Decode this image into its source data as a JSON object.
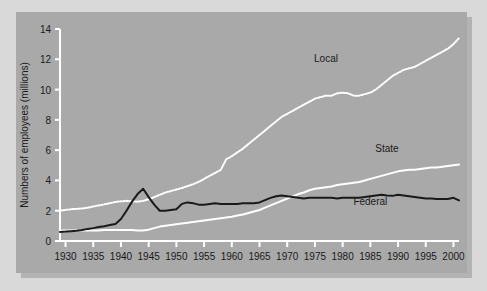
{
  "figure": {
    "background_color": "#d9d9d9",
    "panel_color": "#a9a9a9",
    "shadow_color": "#b3b3b3"
  },
  "chart_data": {
    "type": "line",
    "title": "",
    "xlabel": "",
    "ylabel": "Numbers of employees (millions)",
    "xlim": [
      1929,
      2001
    ],
    "ylim": [
      0,
      14
    ],
    "xticks": [
      1930,
      1935,
      1940,
      1945,
      1950,
      1955,
      1960,
      1965,
      1970,
      1975,
      1980,
      1985,
      1990,
      1995,
      2000
    ],
    "xticklabels": [
      "1930",
      "1935",
      "1940",
      "1945",
      "1950",
      "1955",
      "1960",
      "1965",
      "1970",
      "1975",
      "1980",
      "1985",
      "1990",
      "1995",
      "2000"
    ],
    "yticks": [
      0,
      2,
      4,
      6,
      8,
      10,
      12,
      14
    ],
    "yticklabels": [
      "0",
      "2",
      "4",
      "6",
      "8",
      "10",
      "12",
      "14"
    ],
    "grid": false,
    "legend_position": "inline-annotations",
    "axis_color": "#ffffff",
    "tick_label_color": "#1a1a1a",
    "series": [
      {
        "name": "Local",
        "label": "Local",
        "color": "#ffffff",
        "style": "dotted",
        "label_x": 1977,
        "label_y": 11.85,
        "x": [
          1929,
          1930,
          1931,
          1932,
          1933,
          1934,
          1935,
          1936,
          1937,
          1938,
          1939,
          1940,
          1941,
          1942,
          1943,
          1944,
          1945,
          1946,
          1947,
          1948,
          1949,
          1950,
          1951,
          1952,
          1953,
          1954,
          1955,
          1956,
          1957,
          1958,
          1959,
          1960,
          1961,
          1962,
          1963,
          1964,
          1965,
          1966,
          1967,
          1968,
          1969,
          1970,
          1971,
          1972,
          1973,
          1974,
          1975,
          1976,
          1977,
          1978,
          1979,
          1980,
          1981,
          1982,
          1983,
          1984,
          1985,
          1986,
          1987,
          1988,
          1989,
          1990,
          1991,
          1992,
          1993,
          1994,
          1995,
          1996,
          1997,
          1998,
          1999,
          2000,
          2001
        ],
        "y": [
          2.0,
          2.05,
          2.1,
          2.12,
          2.15,
          2.2,
          2.28,
          2.35,
          2.42,
          2.5,
          2.58,
          2.62,
          2.65,
          2.62,
          2.6,
          2.65,
          2.75,
          2.9,
          3.05,
          3.2,
          3.3,
          3.4,
          3.5,
          3.62,
          3.75,
          3.9,
          4.1,
          4.3,
          4.5,
          4.7,
          5.4,
          5.6,
          5.85,
          6.1,
          6.4,
          6.7,
          7.0,
          7.3,
          7.6,
          7.9,
          8.2,
          8.4,
          8.6,
          8.8,
          9.0,
          9.2,
          9.4,
          9.5,
          9.6,
          9.6,
          9.75,
          9.8,
          9.75,
          9.6,
          9.6,
          9.7,
          9.8,
          10.0,
          10.3,
          10.6,
          10.9,
          11.1,
          11.3,
          11.4,
          11.5,
          11.7,
          11.9,
          12.1,
          12.3,
          12.5,
          12.7,
          13.0,
          13.4
        ]
      },
      {
        "name": "State",
        "label": "State",
        "color": "#ffffff",
        "style": "solid",
        "label_x": 1988,
        "label_y": 5.9,
        "x": [
          1929,
          1930,
          1931,
          1932,
          1933,
          1934,
          1935,
          1936,
          1937,
          1938,
          1939,
          1940,
          1941,
          1942,
          1943,
          1944,
          1945,
          1946,
          1947,
          1948,
          1949,
          1950,
          1951,
          1952,
          1953,
          1954,
          1955,
          1956,
          1957,
          1958,
          1959,
          1960,
          1961,
          1962,
          1963,
          1964,
          1965,
          1966,
          1967,
          1968,
          1969,
          1970,
          1971,
          1972,
          1973,
          1974,
          1975,
          1976,
          1977,
          1978,
          1979,
          1980,
          1981,
          1982,
          1983,
          1984,
          1985,
          1986,
          1987,
          1988,
          1989,
          1990,
          1991,
          1992,
          1993,
          1994,
          1995,
          1996,
          1997,
          1998,
          1999,
          2000,
          2001
        ],
        "y": [
          0.7,
          0.7,
          0.7,
          0.7,
          0.7,
          0.7,
          0.7,
          0.7,
          0.72,
          0.72,
          0.73,
          0.73,
          0.73,
          0.72,
          0.7,
          0.7,
          0.75,
          0.85,
          0.95,
          1.0,
          1.05,
          1.1,
          1.15,
          1.2,
          1.25,
          1.3,
          1.35,
          1.4,
          1.45,
          1.5,
          1.55,
          1.6,
          1.68,
          1.75,
          1.85,
          1.95,
          2.05,
          2.2,
          2.35,
          2.5,
          2.65,
          2.8,
          2.95,
          3.1,
          3.2,
          3.35,
          3.45,
          3.5,
          3.55,
          3.6,
          3.7,
          3.75,
          3.8,
          3.85,
          3.9,
          4.0,
          4.1,
          4.2,
          4.3,
          4.4,
          4.5,
          4.6,
          4.65,
          4.7,
          4.7,
          4.75,
          4.8,
          4.85,
          4.85,
          4.9,
          4.95,
          5.0,
          5.05
        ]
      },
      {
        "name": "Federal",
        "label": "Federal",
        "color": "#1a1a1a",
        "style": "solid",
        "label_x": 1985,
        "label_y": 2.35,
        "x": [
          1929,
          1930,
          1931,
          1932,
          1933,
          1934,
          1935,
          1936,
          1937,
          1938,
          1939,
          1940,
          1941,
          1942,
          1943,
          1944,
          1945,
          1946,
          1947,
          1948,
          1949,
          1950,
          1951,
          1952,
          1953,
          1954,
          1955,
          1956,
          1957,
          1958,
          1959,
          1960,
          1961,
          1962,
          1963,
          1964,
          1965,
          1966,
          1967,
          1968,
          1969,
          1970,
          1971,
          1972,
          1973,
          1974,
          1975,
          1976,
          1977,
          1978,
          1979,
          1980,
          1981,
          1982,
          1983,
          1984,
          1985,
          1986,
          1987,
          1988,
          1989,
          1990,
          1991,
          1992,
          1993,
          1994,
          1995,
          1996,
          1997,
          1998,
          1999,
          2000,
          2001
        ],
        "y": [
          0.6,
          0.62,
          0.65,
          0.68,
          0.72,
          0.8,
          0.85,
          0.92,
          0.98,
          1.05,
          1.12,
          1.45,
          2.0,
          2.6,
          3.1,
          3.45,
          2.9,
          2.4,
          2.0,
          2.0,
          2.05,
          2.1,
          2.45,
          2.55,
          2.5,
          2.4,
          2.4,
          2.45,
          2.5,
          2.45,
          2.45,
          2.45,
          2.45,
          2.5,
          2.5,
          2.5,
          2.55,
          2.7,
          2.85,
          2.95,
          3.0,
          2.95,
          2.9,
          2.85,
          2.8,
          2.85,
          2.85,
          2.85,
          2.85,
          2.85,
          2.8,
          2.85,
          2.85,
          2.85,
          2.85,
          2.9,
          2.95,
          3.0,
          3.05,
          3.0,
          2.98,
          3.05,
          3.0,
          2.95,
          2.9,
          2.85,
          2.8,
          2.8,
          2.78,
          2.78,
          2.78,
          2.85,
          2.68
        ]
      }
    ]
  }
}
